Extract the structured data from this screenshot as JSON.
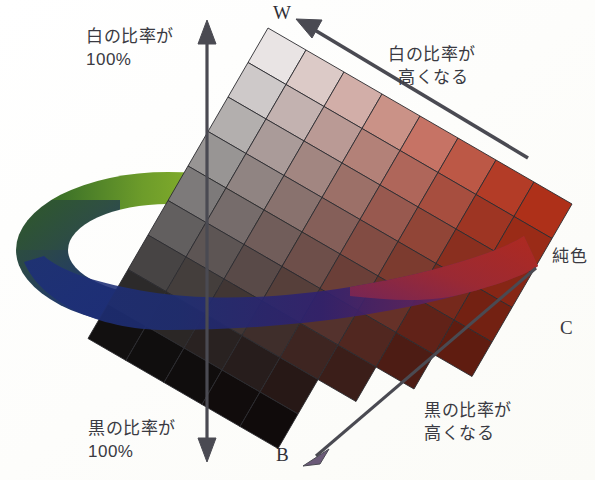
{
  "diagram": {
    "kind": "color-tone-triangle-with-hue-wheel",
    "vertices": {
      "white": {
        "label": "W",
        "name": "white-vertex"
      },
      "black": {
        "label": "B",
        "name": "black-vertex"
      },
      "pure": {
        "label_jp": "純色",
        "label_en": "C",
        "name": "pure-color-vertex"
      }
    },
    "labels": {
      "white_ratio_100": "白の比率が\n100%",
      "black_ratio_100": "黒の比率が\n100%",
      "white_ratio_up": "白の比率が\n  高くなる",
      "black_ratio_up": "黒の比率が\n高くなる"
    },
    "axes": {
      "vertical": {
        "name": "white-black-axis",
        "arrow": "double",
        "x": 207,
        "y1": 24,
        "y2": 458
      },
      "white_diagonal": {
        "name": "white-increase-axis",
        "arrow": "up-left",
        "x1": 528,
        "y1": 158,
        "x2": 300,
        "y2": 18
      },
      "black_diagonal": {
        "name": "black-increase-axis",
        "arrow": "down-left",
        "x1": 536,
        "y1": 268,
        "x2": 306,
        "y2": 462
      }
    },
    "colors": {
      "white": "#ffffff",
      "black": "#090707",
      "pure_color": "#b8321a",
      "arrow": "#4a4a52",
      "text": "#3a3a42",
      "ring_green_light": "#a8c62b",
      "ring_green_dark": "#2f5a26",
      "ring_blue": "#1d2f78",
      "ring_purple": "#6b2560",
      "ring_red": "#b22a1d",
      "grid_line": "#2b2b30"
    },
    "hue_wheel": {
      "name": "hue-ring",
      "shape": "ellipse-ring-perspective",
      "cx": 168,
      "cy": 250,
      "rx": 152,
      "ry": 78,
      "thickness": 44,
      "hue_stops": [
        {
          "pos": 0.0,
          "hex": "#a8c62b",
          "name": "yellow-green"
        },
        {
          "pos": 0.14,
          "hex": "#6d9c2a",
          "name": "green"
        },
        {
          "pos": 0.3,
          "hex": "#2f5a26",
          "name": "dark-green"
        },
        {
          "pos": 0.46,
          "hex": "#26507a",
          "name": "teal-blue"
        },
        {
          "pos": 0.58,
          "hex": "#1d2f78",
          "name": "blue"
        },
        {
          "pos": 0.74,
          "hex": "#3b2070",
          "name": "violet"
        },
        {
          "pos": 0.86,
          "hex": "#6b2560",
          "name": "purple"
        },
        {
          "pos": 1.0,
          "hex": "#b22a1d",
          "name": "red"
        }
      ]
    },
    "tone_grid": {
      "name": "tone-rhombus-grid",
      "rows": 9,
      "cols": 8,
      "description": "Rhombus cells from W (top) through tints/tones to C (right) and shades to B (bottom)",
      "corner_white": "#ffffff",
      "corner_black": "#090707",
      "corner_pure": "#b8321a",
      "corner_gray": "#8d8d8d"
    }
  }
}
